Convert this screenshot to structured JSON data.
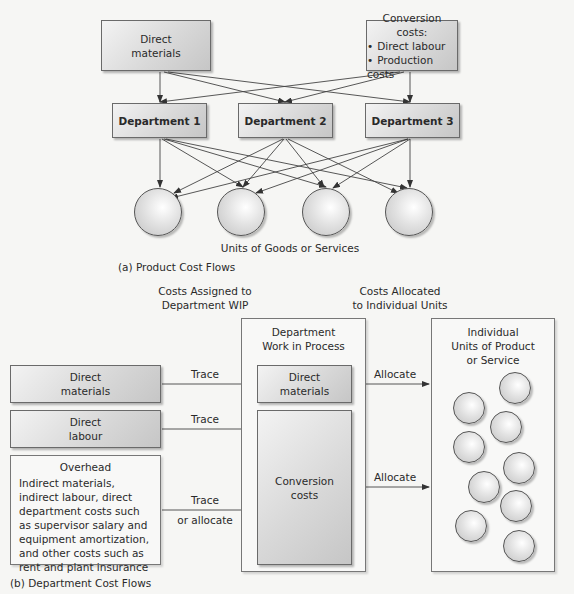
{
  "part_a": {
    "sources": {
      "direct_materials": "Direct\nmaterials",
      "conversion_title": "Conversion costs:",
      "conversion_items": [
        "Direct labour",
        "Production costs"
      ]
    },
    "departments": [
      "Department 1",
      "Department 2",
      "Department 3"
    ],
    "units_label": "Units of Goods or Services",
    "caption": "(a) Product Cost Flows"
  },
  "part_b": {
    "header_left": "Costs Assigned to\nDepartment WIP",
    "header_right": "Costs Allocated\nto Individual Units",
    "inputs": {
      "direct_materials": "Direct\nmaterials",
      "direct_labour": "Direct\nlabour",
      "overhead_title": "Overhead",
      "overhead_body": "Indirect materials, indirect labour, direct department costs such as supervisor salary and equipment amortization, and other costs such as rent and plant insurance"
    },
    "arrow_labels": {
      "trace1": "Trace",
      "trace2": "Trace",
      "trace3_line1": "Trace",
      "trace3_line2": "or allocate",
      "allocate1": "Allocate",
      "allocate2": "Allocate"
    },
    "wip": {
      "title": "Department\nWork in Process",
      "direct_materials": "Direct\nmaterials",
      "conversion": "Conversion\ncosts"
    },
    "units": {
      "title": "Individual\nUnits of Product\nor Service",
      "count": 9
    },
    "caption": "(b) Department Cost Flows"
  }
}
